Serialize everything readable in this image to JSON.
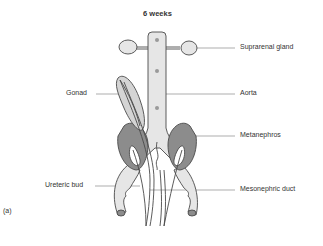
{
  "title": "6 weeks",
  "panel_label": "(a)",
  "labels": {
    "suprarenal_gland": "Suprarenal gland",
    "gonad": "Gonad",
    "aorta": "Aorta",
    "metanephros": "Metanephros",
    "ureteric_bud": "Ureteric bud",
    "mesonephric_duct": "Mesonephric duct"
  },
  "colors": {
    "light_fill": "#e6e6e6",
    "dark_fill": "#8c8c8c",
    "stroke": "#4a4a4a",
    "leader_line": "#777777",
    "dot": "#9a9a9a"
  }
}
